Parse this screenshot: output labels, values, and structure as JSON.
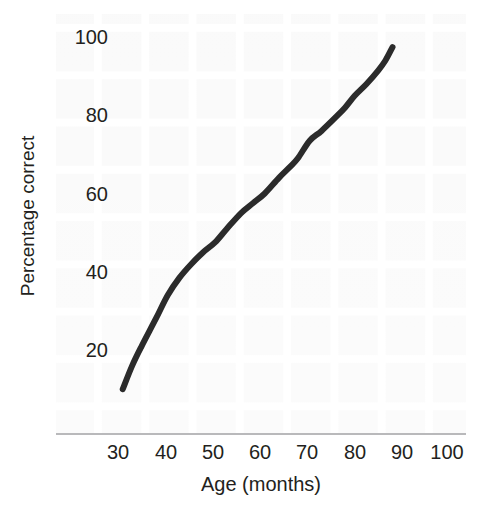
{
  "figure": {
    "background_color": "#ffffff",
    "plot_background_color": "#f5f5f5",
    "line_color": "#2b2b2b",
    "axis_color": "#b9b9bb",
    "text_color": "#231f20"
  },
  "axes": {
    "x_title": "Age (months)",
    "y_title": "Percentage correct",
    "x_ticks": [
      "30",
      "40",
      "50",
      "60",
      "70",
      "80",
      "90",
      "100"
    ],
    "y_ticks": [
      "100",
      "80",
      "60",
      "40",
      "20"
    ]
  },
  "chart_data": {
    "type": "line",
    "title": "",
    "xlabel": "Age (months)",
    "ylabel": "Percentage correct",
    "xlim": [
      24,
      105
    ],
    "ylim": [
      0,
      103
    ],
    "xticks": [
      30,
      40,
      50,
      60,
      70,
      80,
      90,
      100
    ],
    "yticks": [
      20,
      40,
      60,
      80,
      100
    ],
    "grid": true,
    "legend": "none",
    "series": [
      {
        "name": "Percentage correct",
        "color": "#2b2b2b",
        "line_width": 6,
        "x": [
          31,
          33,
          35,
          38,
          40.5,
          43,
          45.5,
          48,
          50.5,
          53,
          56,
          58.5,
          61,
          64,
          66.5,
          68,
          70.5,
          73,
          76,
          78,
          80,
          82.5,
          85,
          86.5,
          88
        ],
        "y": [
          10,
          16,
          21,
          28,
          34,
          38.5,
          42,
          45,
          47.5,
          51,
          55,
          57.5,
          60,
          64,
          67,
          69,
          73.5,
          76,
          79.5,
          82,
          85,
          88,
          91.5,
          94,
          97.4
        ]
      }
    ]
  }
}
